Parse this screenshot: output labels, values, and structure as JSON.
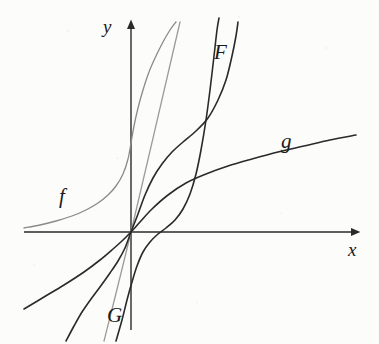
{
  "figure": {
    "title": "",
    "background_color": "#fcfcfb",
    "ink_color": "#2a2a2a",
    "light_ink_color": "#7a7a7a"
  },
  "axes": {
    "x_axis": {
      "label": "x",
      "origin_px": [
        131,
        232
      ],
      "start_px": [
        24,
        232
      ],
      "end_px": [
        358,
        232
      ],
      "arrow": "right",
      "ticks": [],
      "tick_labels": []
    },
    "y_axis": {
      "label": "y",
      "start_px": [
        131,
        330
      ],
      "end_px": [
        131,
        22
      ],
      "arrow": "up",
      "ticks": [],
      "tick_labels": []
    }
  },
  "curve_labels": [
    {
      "id": "f",
      "text": "f",
      "x": 59,
      "y": 186
    },
    {
      "id": "F",
      "text": "F",
      "x": 214,
      "y": 42
    },
    {
      "id": "g",
      "text": "g",
      "x": 281,
      "y": 131
    },
    {
      "id": "G",
      "text": "G",
      "x": 107,
      "y": 305
    }
  ],
  "chart_data": {
    "type": "line",
    "title": "",
    "xlabel": "x",
    "ylabel": "y",
    "grid": false,
    "legend": "inline-curve-labels",
    "axis_origin_px": [
      131,
      232
    ],
    "xlim_px": [
      24,
      358
    ],
    "ylim_px": [
      330,
      22
    ],
    "series": [
      {
        "name": "f",
        "label": "f",
        "color": "#8a8a8a",
        "width": 1.3,
        "description": "increasing convex exponential-like curve through origin, flat asymptote to the left, steep rise at upper right",
        "points_px": [
          [
            24,
            228
          ],
          [
            40,
            225
          ],
          [
            56,
            221
          ],
          [
            72,
            216
          ],
          [
            86,
            210
          ],
          [
            98,
            203
          ],
          [
            108,
            195
          ],
          [
            116,
            186
          ],
          [
            123,
            174
          ],
          [
            128,
            159
          ],
          [
            131,
            143
          ],
          [
            134,
            126
          ],
          [
            138,
            108
          ],
          [
            143,
            90
          ],
          [
            149,
            72
          ],
          [
            156,
            56
          ],
          [
            163,
            42
          ],
          [
            170,
            30
          ],
          [
            176,
            22
          ]
        ]
      },
      {
        "name": "tangent-line",
        "label": "",
        "color": "#9a9a9a",
        "width": 1.3,
        "description": "straight light-gray line through the origin, the common tangent; runs from lower-left bottom up to the top right",
        "points_px": [
          [
            104,
            341
          ],
          [
            131,
            232
          ],
          [
            180,
            22
          ]
        ]
      },
      {
        "name": "F",
        "label": "F",
        "color": "#2a2a2a",
        "width": 1.6,
        "description": "dark steeply-rising antiderivative curve, nearly flat just right of the origin then turning sharply upward",
        "points_px": [
          [
            116,
            341
          ],
          [
            122,
            320
          ],
          [
            127,
            300
          ],
          [
            132,
            282
          ],
          [
            137,
            266
          ],
          [
            143,
            252
          ],
          [
            150,
            242
          ],
          [
            158,
            234
          ],
          [
            166,
            228
          ],
          [
            175,
            220
          ],
          [
            183,
            209
          ],
          [
            190,
            194
          ],
          [
            196,
            174
          ],
          [
            201,
            150
          ],
          [
            206,
            120
          ],
          [
            210,
            90
          ],
          [
            214,
            56
          ],
          [
            217,
            30
          ],
          [
            219,
            18
          ]
        ]
      },
      {
        "name": "g",
        "label": "g",
        "color": "#2a2a2a",
        "width": 1.6,
        "description": "dark increasing concave logarithm-like curve through the origin, steep near origin, flattening to the right",
        "points_px": [
          [
            24,
            309
          ],
          [
            44,
            297
          ],
          [
            64,
            285
          ],
          [
            84,
            272
          ],
          [
            100,
            260
          ],
          [
            113,
            249
          ],
          [
            123,
            240
          ],
          [
            131,
            232
          ],
          [
            140,
            222
          ],
          [
            152,
            209
          ],
          [
            168,
            195
          ],
          [
            186,
            183
          ],
          [
            206,
            174
          ],
          [
            228,
            166
          ],
          [
            252,
            159
          ],
          [
            278,
            152
          ],
          [
            304,
            146
          ],
          [
            330,
            140
          ],
          [
            356,
            135
          ]
        ]
      },
      {
        "name": "G",
        "label": "G",
        "color": "#2a2a2a",
        "width": 1.6,
        "description": "dark S-shaped curve: concave below the x-axis on the left, through the origin, convex and rising steeply on the right",
        "points_px": [
          [
            66,
            341
          ],
          [
            74,
            326
          ],
          [
            82,
            312
          ],
          [
            91,
            299
          ],
          [
            100,
            287
          ],
          [
            110,
            273
          ],
          [
            118,
            261
          ],
          [
            125,
            248
          ],
          [
            131,
            232
          ],
          [
            138,
            214
          ],
          [
            145,
            195
          ],
          [
            153,
            178
          ],
          [
            162,
            164
          ],
          [
            172,
            152
          ],
          [
            183,
            142
          ],
          [
            196,
            131
          ],
          [
            208,
            118
          ],
          [
            218,
            100
          ],
          [
            226,
            80
          ],
          [
            232,
            56
          ],
          [
            236,
            36
          ],
          [
            238,
            22
          ]
        ]
      }
    ]
  }
}
